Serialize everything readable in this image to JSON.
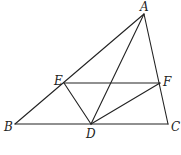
{
  "diagram": {
    "type": "geometry-figure",
    "points": {
      "A": {
        "label": "A",
        "x": 144,
        "y": 14,
        "lx": 140,
        "ly": 11
      },
      "B": {
        "label": "B",
        "x": 15,
        "y": 124,
        "lx": 4,
        "ly": 131
      },
      "C": {
        "label": "C",
        "x": 168,
        "y": 124,
        "lx": 171,
        "ly": 131
      },
      "D": {
        "label": "D",
        "x": 91,
        "y": 124,
        "lx": 86,
        "ly": 138
      },
      "E": {
        "label": "E",
        "x": 64,
        "y": 83,
        "lx": 54,
        "ly": 85
      },
      "F": {
        "label": "F",
        "x": 160,
        "y": 83,
        "lx": 163,
        "ly": 86
      }
    },
    "segments": [
      [
        "A",
        "B"
      ],
      [
        "A",
        "C"
      ],
      [
        "B",
        "C"
      ],
      [
        "A",
        "D"
      ],
      [
        "E",
        "F"
      ],
      [
        "E",
        "D"
      ],
      [
        "F",
        "D"
      ]
    ]
  }
}
